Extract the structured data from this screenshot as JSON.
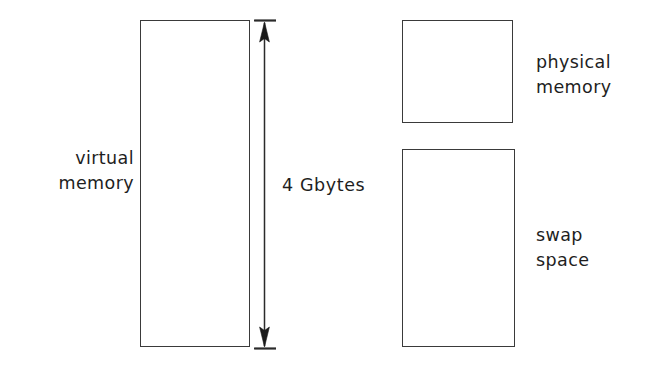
{
  "diagram": {
    "background_color": "#ffffff",
    "stroke_color": "#3a3a3a",
    "text_color": "#1e1e1e",
    "boxes": [
      {
        "id": "virtual-memory",
        "label": "virtual\nmemory",
        "label_position": "left",
        "x": 140,
        "y": 20,
        "width": 110,
        "height": 327
      },
      {
        "id": "physical-memory",
        "label": "physical\nmemory",
        "label_position": "right",
        "x": 402,
        "y": 20,
        "width": 111,
        "height": 103
      },
      {
        "id": "swap-space",
        "label": "swap\nspace",
        "label_position": "right",
        "x": 402,
        "y": 149,
        "width": 113,
        "height": 198
      }
    ],
    "dimension": {
      "label": "4 Gbytes",
      "measures": "virtual-memory",
      "orientation": "vertical",
      "arrowheads": "both",
      "x": 264,
      "y_top": 20,
      "y_bottom": 347
    }
  }
}
